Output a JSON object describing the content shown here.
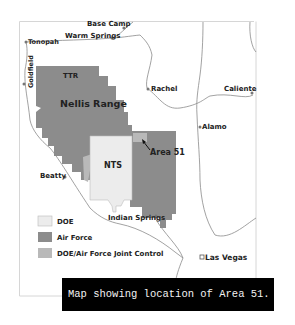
{
  "map": {
    "title": "Map showing location of Area 51.",
    "colors": {
      "doe": "#ececec",
      "air_force": "#8c8c8c",
      "joint": "#b9b9b9",
      "road": "#8a8a8a",
      "frame": "#d6d6d6"
    },
    "places": {
      "base_camp": "Base Camp",
      "warm_springs": "Warm Springs",
      "tonopah": "Tonopah",
      "goldfield": "Goldfield",
      "ttr": "TTR",
      "nellis_range": "Nellis Range",
      "rachel": "Rachel",
      "caliente": "Caliente",
      "alamo": "Alamo",
      "area51": "Area 51",
      "nts": "NTS",
      "beatty": "Beatty",
      "indian_springs": "Indian Springs",
      "las_vegas": "Las Vegas"
    },
    "legend": [
      {
        "label": "DOE",
        "key": "doe"
      },
      {
        "label": "Air Force",
        "key": "air_force"
      },
      {
        "label": "DOE/Air Force Joint Control",
        "key": "joint"
      }
    ]
  },
  "caption": "Map showing location of Area 51."
}
